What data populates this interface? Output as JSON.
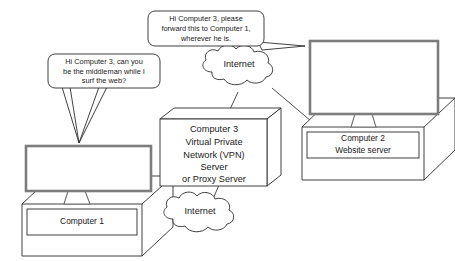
{
  "diagram": {
    "colors": {
      "background": "#ffffff",
      "outline": "#2b2b2b",
      "screen_border": "#7d7d7d",
      "text": "#1a1a1a"
    },
    "speech_bubbles": [
      {
        "id": "bubble-computer2",
        "lines": [
          "Hi Computer 3, please",
          "forward this to Computer 1,",
          "wherever he is."
        ],
        "speaker": "Computer 2"
      },
      {
        "id": "bubble-computer1",
        "lines": [
          "Hi Computer 3, can you",
          "be the middleman while I",
          "surf the web?"
        ],
        "speaker": "Computer 1"
      }
    ],
    "clouds": [
      {
        "id": "cloud-upper",
        "label": "Internet"
      },
      {
        "id": "cloud-lower",
        "label": "Internet"
      }
    ],
    "nodes": [
      {
        "id": "computer-1",
        "type": "workstation",
        "lines": [
          "Computer 1"
        ]
      },
      {
        "id": "computer-3-vpn",
        "type": "server-box",
        "lines": [
          "Computer 3",
          "Virtual Private",
          "Network (VPN)",
          "Server",
          "or Proxy Server"
        ]
      },
      {
        "id": "computer-2",
        "type": "workstation",
        "lines": [
          "Computer 2",
          "Website server"
        ]
      }
    ]
  }
}
